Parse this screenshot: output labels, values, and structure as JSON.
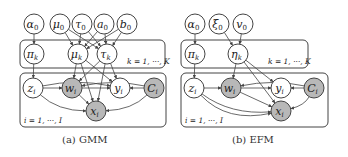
{
  "colors": {
    "line": "#444444",
    "observed_fill": "#b8b8b8",
    "latent_fill": "#ffffff",
    "text": "#222222"
  },
  "figures": [
    {
      "id": "gmm",
      "caption": "(a) GMM",
      "plates": [
        {
          "id": "K",
          "label": "k = 1, ···, K",
          "x": 20,
          "y": 40,
          "w": 145,
          "h": 28,
          "label_x": 127,
          "label_y": 64
        },
        {
          "id": "I",
          "label": "i = 1, ···, I",
          "x": 20,
          "y": 73,
          "w": 146,
          "h": 54,
          "label_x": 24,
          "label_y": 123
        }
      ],
      "nodes": [
        {
          "id": "alpha0",
          "label": "α",
          "sub": "0",
          "x": 34,
          "y": 24,
          "observed": false
        },
        {
          "id": "mu0",
          "label": "μ",
          "sub": "0",
          "x": 60,
          "y": 24,
          "observed": false
        },
        {
          "id": "tau0",
          "label": "τ",
          "sub": "0",
          "x": 82,
          "y": 24,
          "observed": false
        },
        {
          "id": "a0",
          "label": "a",
          "sub": "0",
          "x": 104,
          "y": 24,
          "observed": false
        },
        {
          "id": "b0",
          "label": "b",
          "sub": "0",
          "x": 127,
          "y": 24,
          "observed": false
        },
        {
          "id": "pik",
          "label": "π",
          "sub": "k",
          "x": 34,
          "y": 54,
          "observed": false
        },
        {
          "id": "muk",
          "label": "μ",
          "sub": "k",
          "x": 78,
          "y": 54,
          "observed": false
        },
        {
          "id": "tauk",
          "label": "τ",
          "sub": "k",
          "x": 107,
          "y": 54,
          "observed": false
        },
        {
          "id": "zi",
          "label": "z",
          "sub": "i",
          "x": 33,
          "y": 88,
          "observed": false
        },
        {
          "id": "wi",
          "label": "w",
          "sub": "i",
          "x": 72,
          "y": 88,
          "observed": true
        },
        {
          "id": "yi",
          "label": "y",
          "sub": "i",
          "x": 120,
          "y": 88,
          "observed": false
        },
        {
          "id": "Ci",
          "label": "C",
          "sub": "i",
          "x": 154,
          "y": 88,
          "observed": true
        },
        {
          "id": "xi",
          "label": "x",
          "sub": "i",
          "x": 96,
          "y": 111,
          "observed": true
        }
      ],
      "edges": [
        [
          "alpha0",
          "pik"
        ],
        [
          "mu0",
          "muk"
        ],
        [
          "mu0",
          "tauk"
        ],
        [
          "tau0",
          "muk"
        ],
        [
          "tau0",
          "tauk"
        ],
        [
          "a0",
          "muk"
        ],
        [
          "a0",
          "tauk"
        ],
        [
          "b0",
          "muk"
        ],
        [
          "b0",
          "tauk"
        ],
        [
          "pik",
          "zi"
        ],
        [
          "muk",
          "wi"
        ],
        [
          "muk",
          "yi"
        ],
        [
          "muk",
          "xi"
        ],
        [
          "tauk",
          "wi"
        ],
        [
          "tauk",
          "yi"
        ],
        [
          "tauk",
          "xi"
        ],
        [
          "zi",
          "wi"
        ],
        [
          "zi",
          "xi",
          "curve"
        ],
        [
          "zi",
          "yi",
          "curve"
        ],
        [
          "wi",
          "yi"
        ],
        [
          "wi",
          "xi"
        ],
        [
          "Ci",
          "yi"
        ],
        [
          "Ci",
          "xi",
          "curve"
        ],
        [
          "Ci",
          "wi",
          "curve"
        ]
      ]
    },
    {
      "id": "efm",
      "caption": "(b) EFM",
      "plates": [
        {
          "id": "K",
          "label": "k = 1, ···, K",
          "x": 181,
          "y": 40,
          "w": 127,
          "h": 28,
          "label_x": 268,
          "label_y": 64
        },
        {
          "id": "I",
          "label": "i = 1, ···, I",
          "x": 181,
          "y": 73,
          "w": 147,
          "h": 54,
          "label_x": 185,
          "label_y": 123
        }
      ],
      "nodes": [
        {
          "id": "alpha0",
          "label": "α",
          "sub": "0",
          "x": 195,
          "y": 24,
          "observed": false
        },
        {
          "id": "xi0",
          "label": "ξ",
          "sub": "0",
          "x": 219,
          "y": 24,
          "observed": false
        },
        {
          "id": "v0",
          "label": "v",
          "sub": "0",
          "x": 243,
          "y": 24,
          "observed": false
        },
        {
          "id": "pik",
          "label": "π",
          "sub": "k",
          "x": 195,
          "y": 54,
          "observed": false
        },
        {
          "id": "etak",
          "label": "η",
          "sub": "k",
          "x": 238,
          "y": 54,
          "observed": false
        },
        {
          "id": "zi",
          "label": "z",
          "sub": "i",
          "x": 194,
          "y": 88,
          "observed": false
        },
        {
          "id": "wi",
          "label": "w",
          "sub": "i",
          "x": 231,
          "y": 88,
          "observed": true
        },
        {
          "id": "yi",
          "label": "y",
          "sub": "i",
          "x": 281,
          "y": 88,
          "observed": false
        },
        {
          "id": "Ci",
          "label": "C",
          "sub": "i",
          "x": 314,
          "y": 88,
          "observed": true
        },
        {
          "id": "xi",
          "label": "x",
          "sub": "i",
          "x": 281,
          "y": 111,
          "observed": true
        }
      ],
      "edges": [
        [
          "alpha0",
          "pik"
        ],
        [
          "xi0",
          "etak"
        ],
        [
          "v0",
          "etak"
        ],
        [
          "pik",
          "zi"
        ],
        [
          "etak",
          "wi"
        ],
        [
          "etak",
          "yi"
        ],
        [
          "etak",
          "xi"
        ],
        [
          "zi",
          "wi"
        ],
        [
          "zi",
          "xi",
          "curve"
        ],
        [
          "zi",
          "xi",
          "curve2"
        ],
        [
          "wi",
          "yi"
        ],
        [
          "wi",
          "xi"
        ],
        [
          "Ci",
          "yi"
        ],
        [
          "Ci",
          "xi",
          "curve"
        ],
        [
          "Ci",
          "wi",
          "curve"
        ]
      ]
    }
  ],
  "node_radius": 10
}
